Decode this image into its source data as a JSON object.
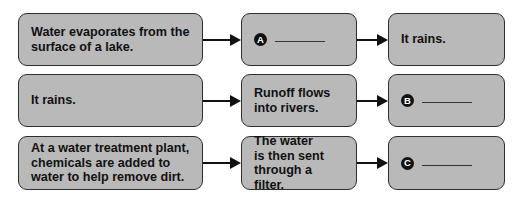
{
  "diagram": {
    "rows": [
      {
        "steps": [
          {
            "type": "text",
            "text": "Water evaporates from the\nsurface of a lake."
          },
          {
            "type": "blank",
            "label": "A"
          },
          {
            "type": "text",
            "text": "It rains."
          }
        ]
      },
      {
        "steps": [
          {
            "type": "text",
            "text": "It rains."
          },
          {
            "type": "text",
            "text": "Runoff flows\ninto rivers."
          },
          {
            "type": "blank",
            "label": "B"
          }
        ]
      },
      {
        "steps": [
          {
            "type": "text",
            "text": "At a water treatment plant,\nchemicals are added to\nwater to help remove dirt."
          },
          {
            "type": "text",
            "text": "The water\nis then sent\nthrough a filter."
          },
          {
            "type": "blank",
            "label": "C"
          }
        ]
      }
    ],
    "colors": {
      "box_fill": "#b9b9b9",
      "box_border": "#2e2e2e",
      "text": "#111111",
      "arrow": "#111111"
    }
  }
}
